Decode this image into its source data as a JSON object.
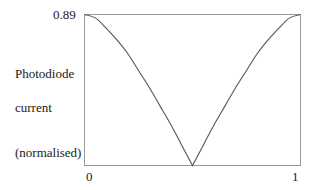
{
  "chart_data": {
    "type": "line",
    "title": "",
    "xlabel": "",
    "ylabel": "Photodiode current (normalised)",
    "ylabel_lines": [
      "Photodiode",
      "current",
      "(normalised)"
    ],
    "x_ticks": [
      "0",
      "1"
    ],
    "y_ticks": [
      "0.89"
    ],
    "xlim": [
      0,
      1
    ],
    "ylim": [
      0,
      0.89
    ],
    "grid": false,
    "legend": null,
    "series": [
      {
        "name": "photodiode current",
        "x": [
          0.0,
          0.05,
          0.1,
          0.15,
          0.2,
          0.25,
          0.3,
          0.35,
          0.4,
          0.45,
          0.5,
          0.55,
          0.6,
          0.65,
          0.7,
          0.75,
          0.8,
          0.85,
          0.9,
          0.95,
          1.0
        ],
        "y": [
          0.89,
          0.87,
          0.81,
          0.74,
          0.66,
          0.56,
          0.46,
          0.35,
          0.24,
          0.12,
          0.0,
          0.12,
          0.24,
          0.35,
          0.46,
          0.56,
          0.66,
          0.74,
          0.81,
          0.87,
          0.89
        ]
      }
    ],
    "color": "#555555"
  },
  "labels": {
    "y_max": "0.89",
    "ylabel_line1": "Photodiode",
    "ylabel_line2": "current",
    "ylabel_line3": "(normalised)",
    "x_min": "0",
    "x_max": "1"
  }
}
